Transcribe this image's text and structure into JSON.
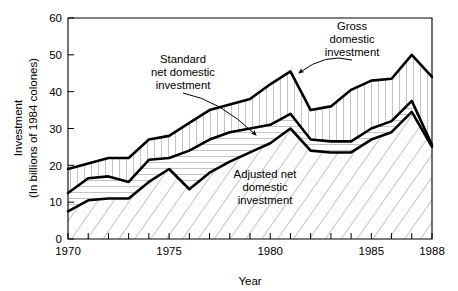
{
  "chart_data": {
    "type": "area",
    "title": "",
    "xlabel": "Year",
    "ylabel": "Investment\n(In billions of 1984 colones)",
    "ylabel_line1": "Investment",
    "ylabel_line2": "(In billions of 1984 colones)",
    "x": [
      1970,
      1971,
      1972,
      1973,
      1974,
      1975,
      1976,
      1977,
      1978,
      1979,
      1980,
      1981,
      1982,
      1983,
      1984,
      1985,
      1986,
      1987,
      1988
    ],
    "xlim": [
      1970,
      1988
    ],
    "ylim": [
      0,
      60
    ],
    "yticks": [
      0,
      10,
      20,
      30,
      40,
      50,
      60
    ],
    "ytick_labels": [
      "0",
      "10",
      "20",
      "30",
      "40",
      "50",
      "60"
    ],
    "xticks": [
      1970,
      1971,
      1972,
      1973,
      1974,
      1975,
      1976,
      1977,
      1978,
      1979,
      1980,
      1981,
      1982,
      1983,
      1984,
      1985,
      1986,
      1987,
      1988
    ],
    "xtick_labels_shown": [
      "1970",
      "1975",
      "1980",
      "1985",
      "1988"
    ],
    "xtick_labeled_values": [
      1970,
      1975,
      1980,
      1985,
      1988
    ],
    "grid": false,
    "legend_position": "inline-annotations",
    "series": [
      {
        "name": "Gross domestic investment",
        "fill": "vertical-hatch",
        "values": [
          19.0,
          20.5,
          22.0,
          22.0,
          27.0,
          28.0,
          31.5,
          35.0,
          36.5,
          38.0,
          42.0,
          45.5,
          35.0,
          36.0,
          40.5,
          43.0,
          43.5,
          50.0,
          44.0
        ]
      },
      {
        "name": "Standard net domestic investment",
        "fill": "horizontal-hatch",
        "values": [
          12.5,
          16.5,
          17.0,
          15.5,
          21.5,
          22.0,
          24.0,
          27.0,
          29.0,
          30.0,
          31.0,
          34.0,
          27.0,
          26.5,
          26.5,
          30.0,
          32.0,
          37.5,
          25.5
        ]
      },
      {
        "name": "Adjusted net domestic investment",
        "fill": "diagonal-hatch",
        "values": [
          7.5,
          10.5,
          11.0,
          11.0,
          15.5,
          19.0,
          13.5,
          18.0,
          21.0,
          23.5,
          26.0,
          30.0,
          24.0,
          23.5,
          23.5,
          27.0,
          29.0,
          34.5,
          25.0
        ]
      }
    ],
    "annotations": [
      {
        "id": "gross",
        "text_lines": [
          "Gross",
          "domestic",
          "investment"
        ],
        "text_x": 352,
        "text_y": 30,
        "target_x": 299,
        "target_y": 73
      },
      {
        "id": "standard",
        "text_lines": [
          "Standard",
          "net domestic",
          "investment"
        ],
        "text_x": 183,
        "text_y": 63,
        "target_x": 256,
        "target_y": 135
      },
      {
        "id": "adjusted",
        "text_lines": [
          "Adjusted net",
          "domestic",
          "investment"
        ],
        "text_x": 265,
        "text_y": 178,
        "target_x": null,
        "target_y": null
      }
    ],
    "colors": {
      "line": "#000000",
      "background": "#ffffff",
      "hatch": "#8a8a8a",
      "axis": "#000000"
    }
  }
}
